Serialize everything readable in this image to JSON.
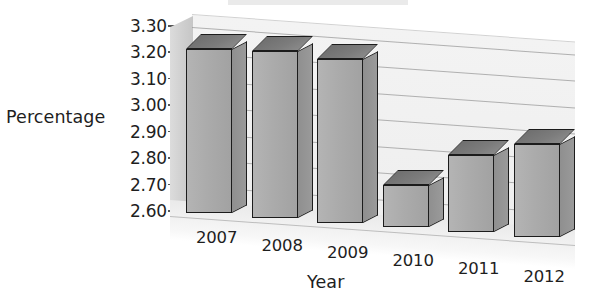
{
  "chart_data": {
    "type": "bar",
    "title": "",
    "xlabel": "Year",
    "ylabel": "Percentage",
    "categories": [
      "2007",
      "2008",
      "2009",
      "2010",
      "2011",
      "2012"
    ],
    "values": [
      3.22,
      3.23,
      3.22,
      2.76,
      2.89,
      2.95
    ],
    "ylim": [
      2.6,
      3.3
    ],
    "ytick_labels": [
      "3.30",
      "3.20",
      "3.10",
      "3.00",
      "2.90",
      "2.80",
      "2.70",
      "2.60"
    ],
    "ytick_values": [
      3.3,
      3.2,
      3.1,
      3.0,
      2.9,
      2.8,
      2.7,
      2.6
    ],
    "grid": true,
    "legend": "none",
    "style": "3d-column",
    "series": [
      {
        "name": "Percentage",
        "values": [
          3.22,
          3.23,
          3.22,
          2.76,
          2.89,
          2.95
        ]
      }
    ],
    "colors": {
      "bar_front": "#ababab",
      "bar_side": "#8f8f8f",
      "bar_top": "#7c7c7c",
      "bar_outline": "#1c1c1c",
      "back_wall": "#eeeeee",
      "left_wall": "#cfcfcf",
      "gridline": "#9a9a9a",
      "text": "#1e1e1e"
    }
  },
  "axes": {
    "y_title": "Percentage",
    "x_title": "Year"
  }
}
